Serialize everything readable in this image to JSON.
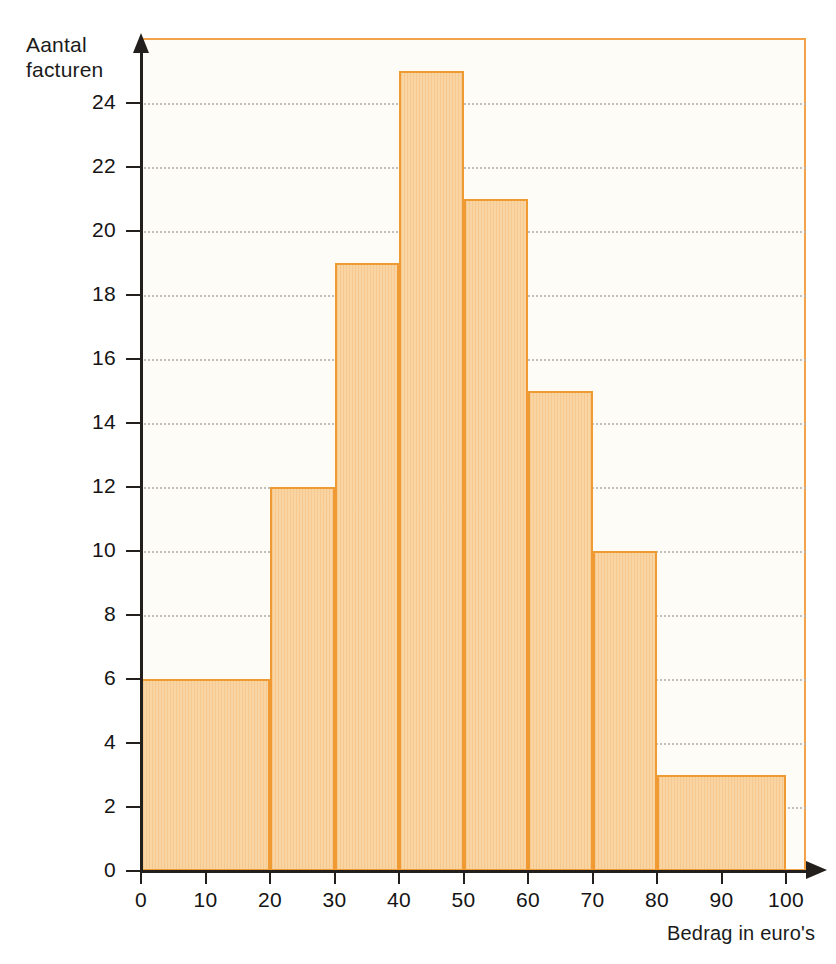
{
  "axes": {
    "y_title": "Aantal\nfacturen",
    "x_title": "Bedrag in euro's",
    "y_ticks": [
      "0",
      "2",
      "4",
      "6",
      "8",
      "10",
      "12",
      "14",
      "16",
      "18",
      "20",
      "22",
      "24"
    ],
    "x_ticks": [
      "0",
      "10",
      "20",
      "30",
      "40",
      "50",
      "60",
      "70",
      "80",
      "90",
      "100"
    ]
  },
  "colors": {
    "bar_fill": "#f8d5a3",
    "bar_stroke": "#f09a33",
    "frame": "#f2a34a",
    "plot_background": "#fdfcf7",
    "axis": "#231f1c",
    "gridline": "#b9b4ac"
  },
  "chart_data": {
    "type": "bar",
    "title": "",
    "xlabel": "Bedrag in euro's",
    "ylabel": "Aantal facturen",
    "xlim": [
      0,
      100
    ],
    "ylim": [
      0,
      26
    ],
    "grid": true,
    "legend": "none",
    "bin_edges": [
      0,
      20,
      30,
      40,
      50,
      60,
      70,
      80,
      100
    ],
    "categories": [
      "0-20",
      "20-30",
      "30-40",
      "40-50",
      "50-60",
      "60-70",
      "70-80",
      "80-100"
    ],
    "values": [
      6,
      12,
      19,
      25,
      21,
      15,
      10,
      3
    ],
    "xticks": [
      0,
      10,
      20,
      30,
      40,
      50,
      60,
      70,
      80,
      90,
      100
    ],
    "yticks": [
      0,
      2,
      4,
      6,
      8,
      10,
      12,
      14,
      16,
      18,
      20,
      22,
      24
    ]
  }
}
